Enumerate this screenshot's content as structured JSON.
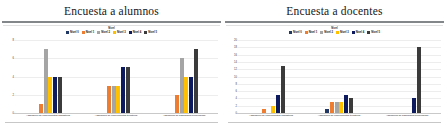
{
  "page": {
    "background": "#ffffff",
    "panel_count": 2
  },
  "palette": {
    "nivel_0": "#1f3864",
    "nivel_1": "#ed7d31",
    "nivel_2": "#a5a5a5",
    "nivel_3": "#ffc000",
    "nivel_4": "#0d1a5e",
    "nivel_5": "#3b3b3b",
    "title_color": "#15161a",
    "rule_color": "#6f7275",
    "grid_color": "#ededed"
  },
  "charts": [
    {
      "title": "Encuesta a alumnos",
      "legend_caption": "Nivel",
      "legend": [
        {
          "label": "Nivel 0",
          "color": "#1f3864"
        },
        {
          "label": "Nivel 1",
          "color": "#ed7d31"
        },
        {
          "label": "Nivel 2",
          "color": "#a5a5a5"
        },
        {
          "label": "Nivel 3",
          "color": "#ffc000"
        },
        {
          "label": "Nivel 4",
          "color": "#0d1a5e"
        },
        {
          "label": "Nivel 5",
          "color": "#3b3b3b"
        }
      ],
      "y_ticks": [
        "8",
        "6",
        "4",
        "2",
        "0"
      ],
      "categories": [
        "Adquisición de conocimientos lingüísticos",
        "Adquisición de conocimientos temáticos",
        "Adquisición de habilidades tecnológicas"
      ],
      "chart_data": {
        "type": "bar",
        "title": "Encuesta a alumnos",
        "xlabel": "",
        "ylabel": "",
        "ylim": [
          0,
          8
        ],
        "grid": true,
        "legend_position": "top",
        "categories": [
          "Adquisición de conocimientos lingüísticos",
          "Adquisición de conocimientos temáticos",
          "Adquisición de habilidades tecnológicas"
        ],
        "series": [
          {
            "name": "Nivel 0",
            "color": "#1f3864",
            "values": [
              0,
              0,
              0
            ]
          },
          {
            "name": "Nivel 1",
            "color": "#ed7d31",
            "values": [
              1,
              3,
              2
            ]
          },
          {
            "name": "Nivel 2",
            "color": "#a5a5a5",
            "values": [
              7,
              3,
              6
            ]
          },
          {
            "name": "Nivel 3",
            "color": "#ffc000",
            "values": [
              4,
              3,
              4
            ]
          },
          {
            "name": "Nivel 4",
            "color": "#0d1a5e",
            "values": [
              4,
              5,
              4
            ]
          },
          {
            "name": "Nivel 5",
            "color": "#3b3b3b",
            "values": [
              4,
              5,
              7
            ]
          }
        ]
      }
    },
    {
      "title": "Encuesta a docentes",
      "legend_caption": "Nivel",
      "legend": [
        {
          "label": "Nivel 0",
          "color": "#1f3864"
        },
        {
          "label": "Nivel 1",
          "color": "#ed7d31"
        },
        {
          "label": "Nivel 2",
          "color": "#a5a5a5"
        },
        {
          "label": "Nivel 3",
          "color": "#ffc000"
        },
        {
          "label": "Nivel 4",
          "color": "#0d1a5e"
        },
        {
          "label": "Nivel 5",
          "color": "#3b3b3b"
        }
      ],
      "y_ticks": [
        "20",
        "18",
        "16",
        "14",
        "12",
        "10",
        "8",
        "6",
        "4",
        "2",
        "0"
      ],
      "categories": [
        "Adquisición de conocimientos lingüísticos",
        "Adquisición de conocimientos temáticos",
        "Adquisición de habilidades tecnológicas"
      ],
      "chart_data": {
        "type": "bar",
        "title": "Encuesta a docentes",
        "xlabel": "",
        "ylabel": "",
        "ylim": [
          0,
          20
        ],
        "grid": true,
        "legend_position": "top",
        "categories": [
          "Adquisición de conocimientos lingüísticos",
          "Adquisición de conocimientos temáticos",
          "Adquisición de habilidades tecnológicas"
        ],
        "series": [
          {
            "name": "Nivel 0",
            "color": "#1f3864",
            "values": [
              0,
              1,
              0
            ]
          },
          {
            "name": "Nivel 1",
            "color": "#ed7d31",
            "values": [
              1,
              3,
              0
            ]
          },
          {
            "name": "Nivel 2",
            "color": "#a5a5a5",
            "values": [
              0,
              3,
              0
            ]
          },
          {
            "name": "Nivel 3",
            "color": "#ffc000",
            "values": [
              2,
              3,
              0
            ]
          },
          {
            "name": "Nivel 4",
            "color": "#0d1a5e",
            "values": [
              5,
              5,
              4
            ]
          },
          {
            "name": "Nivel 5",
            "color": "#3b3b3b",
            "values": [
              13,
              4,
              18
            ]
          }
        ]
      }
    }
  ]
}
